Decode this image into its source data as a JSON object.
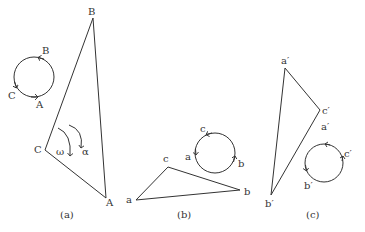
{
  "panels": [
    {
      "caption": "(a)",
      "triangle_vertices": {
        "A": "A",
        "B": "B",
        "C": "C"
      },
      "circle_labels": {
        "B": "B",
        "C": "C",
        "A": "A"
      },
      "angular_labels": {
        "omega": "ω",
        "alpha": "α"
      }
    },
    {
      "caption": "(b)",
      "triangle_vertices": {
        "a": "a",
        "b": "b",
        "c": "c"
      },
      "circle_labels": {
        "c": "c",
        "a": "a",
        "b": "b"
      }
    },
    {
      "caption": "(c)",
      "triangle_vertices": {
        "a": "a′",
        "b": "b′",
        "c": "c′"
      },
      "circle_labels": {
        "a": "a′",
        "c": "c′",
        "b": "b′"
      }
    }
  ],
  "colors": {
    "stroke": "#333333",
    "background": "#ffffff"
  }
}
